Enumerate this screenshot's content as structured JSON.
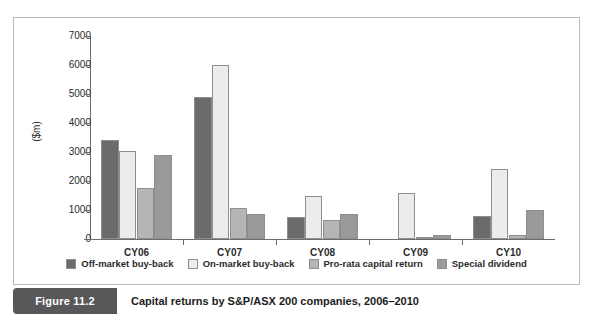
{
  "figure": {
    "badge": "Figure 11.2",
    "caption": "Capital returns by S&P/ASX 200 companies, 2006–2010"
  },
  "chart_data": {
    "type": "bar",
    "title": "",
    "xlabel": "",
    "ylabel": "($m)",
    "ylim": [
      0,
      7000
    ],
    "ytick_step": 1000,
    "yticks": [
      0,
      1000,
      2000,
      3000,
      4000,
      5000,
      6000,
      7000
    ],
    "ytick_labels": [
      "0",
      "1000",
      "2000",
      "3000",
      "4000",
      "5000",
      "6000",
      "7000"
    ],
    "grid": false,
    "legend_position": "bottom",
    "categories": [
      "CY06",
      "CY07",
      "CY08",
      "CY09",
      "CY10"
    ],
    "series": [
      {
        "name": "Off-market buy-back",
        "color": "#6b6b6b",
        "values": [
          3400,
          4880,
          750,
          0,
          800
        ]
      },
      {
        "name": "On-market buy-back",
        "color": "#ececec",
        "values": [
          3020,
          6000,
          1500,
          1600,
          2420
        ]
      },
      {
        "name": "Pro-rata capital return",
        "color": "#b5b5b5",
        "values": [
          1760,
          1080,
          640,
          60,
          150
        ]
      },
      {
        "name": "Special dividend",
        "color": "#9a9a9a",
        "values": [
          2900,
          850,
          850,
          130,
          1000
        ]
      }
    ]
  }
}
